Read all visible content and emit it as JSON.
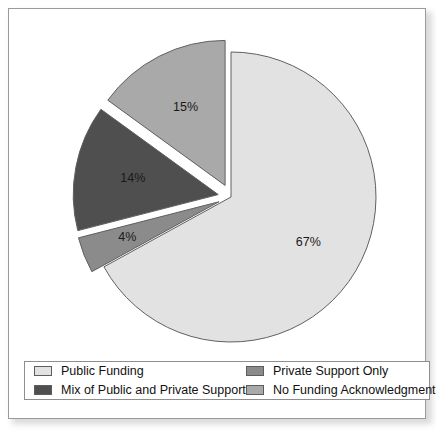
{
  "chart_data": {
    "type": "pie",
    "title": "",
    "subtitle": "",
    "xlabel": "",
    "ylabel": "",
    "legend_position": "bottom",
    "grid": false,
    "exploded": true,
    "start_angle_deg": 0,
    "direction": "clockwise",
    "categories": [
      "Public Funding",
      "Private Support Only",
      "Mix of Public and Private Support",
      "No Funding Acknowledgment"
    ],
    "values": [
      67,
      4,
      14,
      15
    ],
    "slices": [
      {
        "label": "Public Funding",
        "value": 67,
        "data_label": "67%",
        "color": "#e2e2e2",
        "exploded": false
      },
      {
        "label": "Private Support Only",
        "value": 4,
        "data_label": "4%",
        "color": "#8b8b8b",
        "exploded": true
      },
      {
        "label": "Mix of Public and Private Support",
        "value": 14,
        "data_label": "14%",
        "color": "#4f4f4f",
        "exploded": true
      },
      {
        "label": "No Funding Acknowledgment",
        "value": 15,
        "data_label": "15%",
        "color": "#a9a9a9",
        "exploded": true
      }
    ]
  },
  "legend": {
    "entries": [
      {
        "label": "Public Funding",
        "color": "#e2e2e2"
      },
      {
        "label": "Private Support Only",
        "color": "#8b8b8b"
      },
      {
        "label": "Mix of Public and Private Support",
        "color": "#4f4f4f"
      },
      {
        "label": "No Funding Acknowledgment",
        "color": "#a9a9a9"
      }
    ]
  },
  "style": {
    "slice_outline": "#606060",
    "frame_border": "#9a9a9a",
    "background": "#ffffff"
  }
}
